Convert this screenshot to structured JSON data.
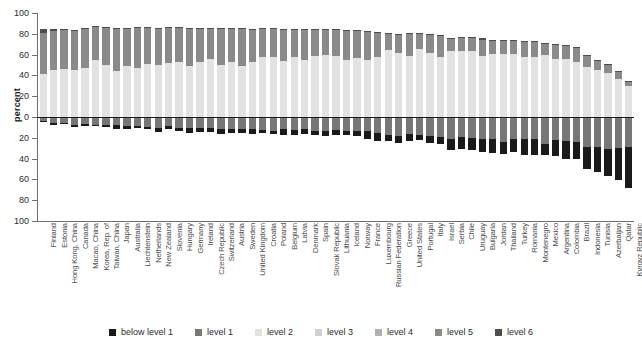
{
  "chart_data": {
    "type": "bar",
    "subtype": "diverging-stacked-bar",
    "title": "",
    "xlabel": "",
    "ylabel": "percent",
    "ylim": [
      -100,
      100
    ],
    "yticks": [
      100,
      80,
      60,
      40,
      20,
      0,
      20,
      40,
      60,
      80,
      100
    ],
    "grid": false,
    "legend_position": "bottom",
    "legend": [
      "below level 1",
      "level 1",
      "level 2",
      "level 3",
      "level 4",
      "level 5",
      "level 6"
    ],
    "colors": {
      "below level 1": "#1a1a1a",
      "level 1": "#777777",
      "level 2": "#e2e2e2",
      "level 3": "#d0d0d0",
      "level 4": "#b0b0b0",
      "level 5": "#8a8a8a",
      "level 6": "#4d4d4d",
      "axis": "#6f6f6f",
      "zero_line": "#1a1a1a",
      "text": "#2b2b2b"
    },
    "negative_series": [
      "below level 1",
      "level 1"
    ],
    "positive_series": [
      "level 2",
      "level 3",
      "level 4",
      "level 5",
      "level 6"
    ],
    "categories": [
      "Finland",
      "Estonia",
      "Hong Kong, China",
      "Canada",
      "Macao, China",
      "Korea, Rep. of",
      "Taiwan, China",
      "Japan",
      "Australia",
      "Liechtenstein",
      "Netherlands",
      "New Zealand",
      "Slovenia",
      "Hungary",
      "Germany",
      "Ireland",
      "Czech Republic",
      "Switzerland",
      "Austria",
      "Sweden",
      "United Kingdom",
      "Croatia",
      "Poland",
      "Belgium",
      "Latvia",
      "Denmark",
      "Spain",
      "Slovak Republic",
      "Lithuania",
      "Iceland",
      "Norway",
      "France",
      "Luxembourg",
      "Russian Federation",
      "Greece",
      "United States",
      "Portugal",
      "Italy",
      "Israel",
      "Serbia",
      "Chile",
      "Uruguay",
      "Bulgaria",
      "Jordan",
      "Thailand",
      "Turkey",
      "Romania",
      "Montenegro",
      "Mexico",
      "Argentina",
      "Colombia",
      "Brazil",
      "Indonesia",
      "Tunisia",
      "Azerbaijan",
      "Qatar",
      "Kyrgyz Republic"
    ],
    "series": [
      {
        "name": "below level 1",
        "direction": "negative",
        "values": [
          1.1,
          2.0,
          1.7,
          2.0,
          1.6,
          1.2,
          1.6,
          3.3,
          3.0,
          2.6,
          2.0,
          4.0,
          2.2,
          3.0,
          4.0,
          3.3,
          3.5,
          4.0,
          4.2,
          4.0,
          4.8,
          3.1,
          3.2,
          5.2,
          5.0,
          4.5,
          4.7,
          5.2,
          4.8,
          4.4,
          5.2,
          8.0,
          7.5,
          5.2,
          7.3,
          7.5,
          5.6,
          7.4,
          7.4,
          10.8,
          11.3,
          11.6,
          12.2,
          14.0,
          12.0,
          12.5,
          15.0,
          15.7,
          11.0,
          15.5,
          17.0,
          16.0,
          21.0,
          24.0,
          26.5,
          31.0,
          39.5
        ]
      },
      {
        "name": "level 1",
        "direction": "negative",
        "values": [
          3.7,
          6.0,
          5.5,
          8.0,
          6.6,
          7.6,
          8.1,
          8.0,
          9.0,
          8.4,
          9.5,
          10.4,
          9.0,
          10.4,
          11.0,
          10.9,
          11.0,
          12.0,
          11.6,
          11.4,
          11.7,
          12.6,
          13.0,
          11.7,
          12.6,
          11.7,
          13.0,
          13.0,
          12.5,
          13.2,
          13.0,
          13.2,
          15.5,
          17.4,
          18.0,
          16.0,
          17.0,
          18.0,
          19.0,
          21.0,
          19.5,
          20.0,
          21.0,
          21.0,
          24.0,
          21.5,
          21.5,
          21.0,
          26.0,
          22.0,
          23.0,
          24.5,
          29.0,
          29.0,
          30.5,
          30.0,
          28.5
        ]
      },
      {
        "name": "level 2",
        "direction": "positive",
        "values": [
          41.0,
          45.0,
          46.5,
          45.0,
          47.0,
          54.5,
          50.0,
          44.0,
          49.0,
          47.5,
          51.0,
          50.0,
          52.0,
          53.0,
          49.0,
          53.0,
          56.0,
          50.0,
          53.0,
          49.0,
          53.0,
          58.0,
          58.0,
          54.0,
          58.0,
          54.5,
          59.0,
          59.5,
          59.0,
          55.0,
          57.0,
          55.0,
          58.0,
          64.0,
          62.0,
          59.0,
          65.0,
          62.0,
          58.0,
          63.0,
          63.0,
          63.0,
          58.5,
          61.0,
          61.0,
          61.0,
          58.0,
          58.0,
          60.0,
          56.0,
          56.0,
          53.0,
          48.0,
          45.0,
          42.0,
          37.0,
          29.5
        ]
      },
      {
        "name": "level 3",
        "direction": "positive",
        "values": [
          0,
          0,
          0,
          0,
          0,
          0,
          0,
          0,
          0,
          0,
          0,
          0,
          0,
          0,
          0,
          0,
          0,
          0,
          0,
          0,
          0,
          0,
          0,
          0,
          0,
          0,
          0,
          0,
          0,
          0,
          0,
          0,
          0,
          0,
          0,
          0,
          0,
          0,
          0,
          0,
          0,
          0,
          0,
          0,
          0,
          0,
          0,
          0,
          0,
          0,
          0,
          0,
          0,
          0,
          0,
          0,
          0
        ]
      },
      {
        "name": "level 4",
        "direction": "positive",
        "values": [
          0,
          0,
          0,
          0,
          0,
          0,
          0,
          0,
          0,
          0,
          0,
          0,
          0,
          0,
          0,
          0,
          0,
          0,
          0,
          0,
          0,
          0,
          0,
          0,
          0,
          0,
          0,
          0,
          0,
          0,
          0,
          0,
          0,
          0,
          0,
          0,
          0,
          0,
          0,
          0,
          0,
          0,
          0,
          0,
          0,
          0,
          0,
          0,
          0,
          0,
          0,
          0,
          0,
          0,
          0,
          0,
          0
        ]
      },
      {
        "name": "level 5",
        "direction": "positive",
        "values": [
          40.0,
          38.0,
          37.0,
          38.0,
          38.0,
          32.0,
          36.0,
          41.0,
          36.0,
          38.0,
          35.0,
          35.0,
          34.0,
          33.0,
          36.0,
          32.0,
          29.0,
          35.0,
          32.0,
          36.0,
          31.0,
          27.0,
          27.0,
          30.0,
          26.0,
          29.0,
          25.0,
          24.0,
          24.5,
          28.0,
          26.0,
          27.0,
          23.0,
          16.0,
          17.0,
          21.0,
          15.0,
          17.0,
          20.0,
          12.0,
          13.0,
          12.5,
          16.0,
          12.0,
          12.0,
          12.5,
          14.0,
          14.0,
          10.0,
          13.0,
          12.0,
          13.0,
          11.0,
          9.0,
          8.0,
          6.5,
          4.0
        ]
      },
      {
        "name": "level 6",
        "direction": "positive",
        "values": [
          4.0,
          2.0,
          1.5,
          1.0,
          1.0,
          1.0,
          1.0,
          1.0,
          1.0,
          1.0,
          1.0,
          1.0,
          1.0,
          1.0,
          1.0,
          1.0,
          1.0,
          1.0,
          1.0,
          1.0,
          1.0,
          1.0,
          1.0,
          1.0,
          1.0,
          1.0,
          1.0,
          1.0,
          1.0,
          1.0,
          1.0,
          1.0,
          1.0,
          1.0,
          1.0,
          1.0,
          1.0,
          1.0,
          1.0,
          1.0,
          1.0,
          1.0,
          1.0,
          1.0,
          1.0,
          1.0,
          1.0,
          1.0,
          1.0,
          1.0,
          1.0,
          1.0,
          1.0,
          1.0,
          1.0,
          1.0,
          1.0
        ]
      }
    ]
  }
}
